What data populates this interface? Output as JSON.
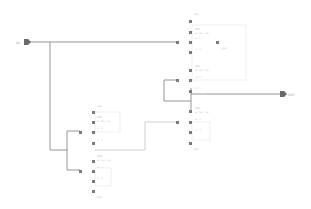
{
  "ports": {
    "input": {
      "label": "IN"
    },
    "output": {
      "label": "OUT"
    }
  },
  "components": [
    {
      "id": "top",
      "supply": "vdd",
      "devices": [
        {
          "name": "PM0",
          "params": [
            "w=2u l=1u",
            "m=1",
            "nf=1"
          ]
        },
        {
          "name": "PM1",
          "params": [
            "w=2u l=1u",
            "m=1",
            "nf=1"
          ]
        }
      ],
      "bulk_label": "gnd"
    },
    {
      "id": "mid",
      "devices": [
        {
          "name": "NM2",
          "params": [
            "w=1u l=1u",
            "m=1",
            "nf=1"
          ]
        }
      ],
      "ground": "gnd"
    },
    {
      "id": "left",
      "supply": "vdd",
      "devices": [
        {
          "name": "PM3",
          "params": [
            "w=2u l=1u",
            "m=1",
            "nf=1"
          ]
        },
        {
          "name": "NM4",
          "params": [
            "w=1u l=1u",
            "m=1",
            "nf=1"
          ]
        }
      ],
      "ground": "gnd"
    }
  ],
  "colors": {
    "wire": "#8a8a8a",
    "pin": "#7a7a7a",
    "box": "#dcdcdc",
    "text": "#b8b8b8"
  }
}
